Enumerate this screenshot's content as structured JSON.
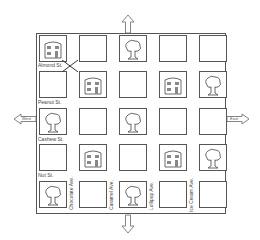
{
  "map": {
    "grid": [
      [
        "house",
        "empty",
        "tree",
        "empty",
        "empty"
      ],
      [
        "empty",
        "house",
        "empty",
        "house",
        "tree"
      ],
      [
        "tree",
        "empty",
        "tree",
        "empty",
        "empty"
      ],
      [
        "empty",
        "house",
        "empty",
        "house",
        "tree"
      ],
      [
        "tree",
        "empty",
        "tree",
        "empty",
        "empty"
      ]
    ],
    "streets": [
      "Almond St.",
      "Peanut St.",
      "Cashew St.",
      "Nut St."
    ],
    "avenues": [
      "Chocolate Ave.",
      "Caramel Ave.",
      "Lollipop Ave.",
      "Ice Cream Ave."
    ],
    "directions": {
      "west": "West",
      "east": "East"
    },
    "colors": {
      "line": "#555555",
      "background": "#ffffff"
    }
  }
}
